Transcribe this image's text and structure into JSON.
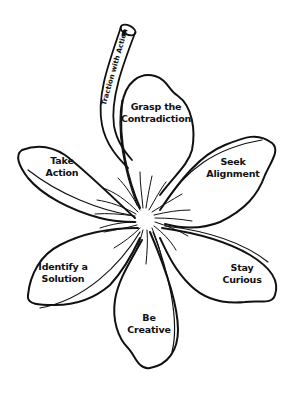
{
  "diagram": {
    "type": "flower",
    "line_color": "#111111",
    "background": "#ffffff",
    "stem": {
      "label": "Traction with Action"
    },
    "petals": [
      {
        "id": "top",
        "line1": "Grasp the",
        "line2": "Contradiction"
      },
      {
        "id": "upper-right",
        "line1": "Seek",
        "line2": "Alignment"
      },
      {
        "id": "lower-right",
        "line1": "Stay",
        "line2": "Curious"
      },
      {
        "id": "bottom",
        "line1": "Be",
        "line2": "Creative"
      },
      {
        "id": "lower-left",
        "line1": "Identify a",
        "line2": "Solution"
      },
      {
        "id": "upper-left",
        "line1": "Take",
        "line2": "Action"
      }
    ]
  }
}
